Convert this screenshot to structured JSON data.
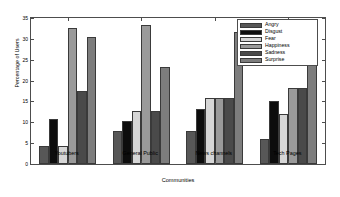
{
  "chart_data": {
    "type": "bar",
    "title": "",
    "xlabel": "Communities",
    "ylabel": "Percentage of Users",
    "categories": [
      "Youtubers",
      "General Public",
      "News channels",
      "Tech Pages"
    ],
    "ylim": [
      0,
      35
    ],
    "yticks": [
      0,
      5,
      10,
      15,
      20,
      25,
      30,
      35
    ],
    "grid": false,
    "legend_position": "top-right",
    "series": [
      {
        "name": "Angry",
        "color": "#575757",
        "values": [
          4.4,
          7.8,
          8.0,
          6.1
        ]
      },
      {
        "name": "Disgust",
        "color": "#0d0d0d",
        "values": [
          10.9,
          10.3,
          13.2,
          15.2
        ]
      },
      {
        "name": "Fear",
        "color": "#d6d6d6",
        "values": [
          4.4,
          12.8,
          15.8,
          12.1
        ]
      },
      {
        "name": "Happiness",
        "color": "#9a9a9a",
        "values": [
          32.7,
          33.4,
          15.8,
          18.2
        ]
      },
      {
        "name": "Sadness",
        "color": "#4a4a4a",
        "values": [
          17.4,
          12.8,
          15.8,
          18.2
        ]
      },
      {
        "name": "Surprise",
        "color": "#7d7d7d",
        "values": [
          30.5,
          23.2,
          31.6,
          30.4
        ]
      }
    ]
  }
}
